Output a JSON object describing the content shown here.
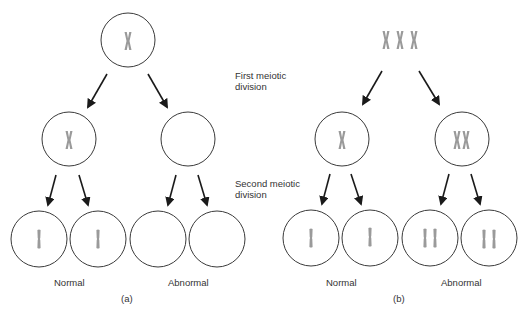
{
  "diagram": {
    "type": "meiotic nondisjunction of sex chromosomes",
    "stage_labels": {
      "first": "First meiotic\ndivision",
      "first_line1": "First meiotic",
      "first_line2": "division",
      "second_line1": "Second meiotic",
      "second_line2": "division"
    },
    "panels": [
      {
        "id": "a",
        "caption": "(a)",
        "parent": {
          "chromosomes": 1,
          "contents": "X"
        },
        "first_division": [
          {
            "chromosomes": 1,
            "contents": "X"
          },
          {
            "chromosomes": 0,
            "contents": "empty"
          }
        ],
        "second_division": [
          {
            "chromatids": 1
          },
          {
            "chromatids": 1
          },
          {
            "chromatids": 0
          },
          {
            "chromatids": 0
          }
        ],
        "outcome_labels": {
          "left": "Normal",
          "right": "Abnormal"
        }
      },
      {
        "id": "b",
        "caption": "(b)",
        "parent": {
          "chromosomes": 3,
          "contents": "XXX"
        },
        "first_division": [
          {
            "chromosomes": 1,
            "contents": "X"
          },
          {
            "chromosomes": 2,
            "contents": "XX"
          }
        ],
        "second_division": [
          {
            "chromatids": 1
          },
          {
            "chromatids": 1
          },
          {
            "chromatids": 2
          },
          {
            "chromatids": 2
          }
        ],
        "outcome_labels": {
          "left": "Normal",
          "right": "Abnormal"
        }
      }
    ],
    "colors": {
      "outline": "#3a3a3a",
      "chromosome": "#9a9a9a",
      "arrow": "#1a1a1a"
    }
  }
}
